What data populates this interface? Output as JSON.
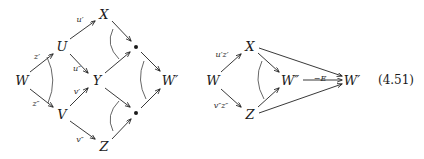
{
  "figure": {
    "kind": "commutative-diagram",
    "equation_number": "(4.51)",
    "left_diagram": {
      "nodes": [
        {
          "id": "W",
          "label": "W",
          "x": 22,
          "y": 80
        },
        {
          "id": "U",
          "label": "U",
          "x": 62,
          "y": 46
        },
        {
          "id": "V",
          "label": "V",
          "x": 62,
          "y": 114
        },
        {
          "id": "X",
          "label": "X",
          "x": 104,
          "y": 14
        },
        {
          "id": "Y",
          "label": "Y",
          "x": 97,
          "y": 80
        },
        {
          "id": "Z",
          "label": "Z",
          "x": 104,
          "y": 146
        },
        {
          "id": "P1",
          "label": "•",
          "x": 136,
          "y": 47
        },
        {
          "id": "P2",
          "label": "•",
          "x": 136,
          "y": 113
        },
        {
          "id": "W1",
          "label": "W′",
          "x": 170,
          "y": 80
        }
      ],
      "edge_labels": [
        {
          "text": "z′",
          "x": 37,
          "y": 57
        },
        {
          "text": "z″",
          "x": 36,
          "y": 104
        },
        {
          "text": "u′",
          "x": 80,
          "y": 20
        },
        {
          "text": "u″",
          "x": 77,
          "y": 69
        },
        {
          "text": "v′",
          "x": 77,
          "y": 92
        },
        {
          "text": "v″",
          "x": 80,
          "y": 140
        }
      ]
    },
    "right_diagram": {
      "nodes": [
        {
          "id": "W",
          "label": "W",
          "x": 213,
          "y": 80
        },
        {
          "id": "X",
          "label": "X",
          "x": 250,
          "y": 46
        },
        {
          "id": "Z",
          "label": "Z",
          "x": 250,
          "y": 114
        },
        {
          "id": "W2",
          "label": "W″",
          "x": 290,
          "y": 80
        },
        {
          "id": "W1",
          "label": "W′",
          "x": 352,
          "y": 80
        }
      ],
      "edge_labels": [
        {
          "text": "u′z′",
          "x": 222,
          "y": 55
        },
        {
          "text": "v″z″",
          "x": 221,
          "y": 106
        },
        {
          "text": "−E",
          "x": 320,
          "y": 79
        }
      ]
    }
  }
}
